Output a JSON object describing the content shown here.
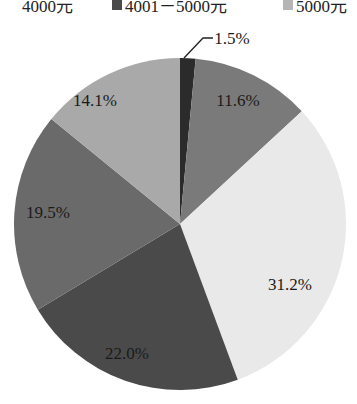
{
  "chart_data": {
    "type": "pie",
    "title": "",
    "legend_position": "top",
    "legend": [
      {
        "label": "4000元",
        "color": "#3a3a3a"
      },
      {
        "label": "4001－5000元",
        "color": "#6e6e6e"
      },
      {
        "label": "5000元",
        "color": "#b8b8b8"
      }
    ],
    "categories": [
      "slice-1",
      "slice-2",
      "slice-3",
      "slice-4",
      "slice-5",
      "slice-6"
    ],
    "values": [
      1.5,
      11.6,
      31.2,
      22.0,
      19.5,
      14.1
    ],
    "labels": [
      "1.5%",
      "11.6%",
      "31.2%",
      "22.0%",
      "19.5%",
      "14.1%"
    ],
    "colors": [
      "#2b2b2b",
      "#7a7a7a",
      "#e9e9e9",
      "#4a4a4a",
      "#6a6a6a",
      "#a9a9a9"
    ],
    "start_angle_deg": 0,
    "direction": "clockwise"
  },
  "legend_text": {
    "item1": "4000元",
    "item2": "4001－5000元",
    "item3": "5000元"
  }
}
